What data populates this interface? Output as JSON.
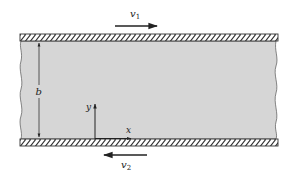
{
  "figure": {
    "type": "couette-flow-parallel-plates",
    "colors": {
      "background": "#ffffff",
      "fluid": "#d6d6d6",
      "ink": "#222222",
      "plate_outline": "#333333"
    },
    "top_plate": {
      "velocity_label": "v",
      "velocity_subscript": "1",
      "direction": "right"
    },
    "bottom_plate": {
      "velocity_label": "v",
      "velocity_subscript": "2",
      "direction": "left"
    },
    "gap": {
      "label": "b"
    },
    "axes": {
      "x_label": "x",
      "y_label": "y"
    }
  }
}
